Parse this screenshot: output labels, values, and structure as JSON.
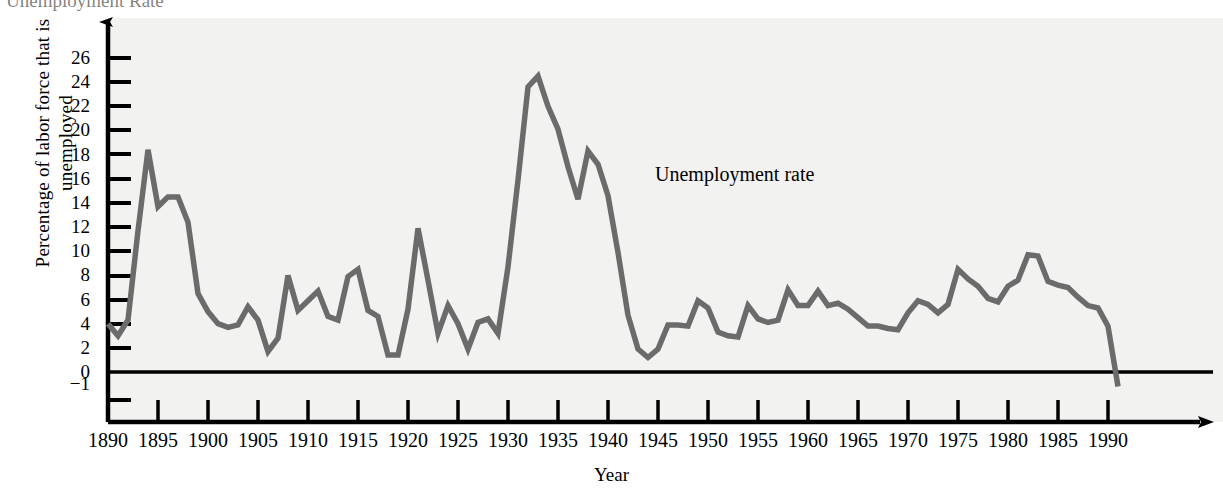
{
  "figure": {
    "clipped_heading": "Unemployment Rate",
    "background_color": "#f2f2f0",
    "line_color": "#6b6b6b",
    "axis_color": "#000000"
  },
  "annotations": [
    {
      "name": "series-label",
      "text": "Unemployment rate",
      "x": 655,
      "y": 164
    }
  ],
  "chart_data": {
    "type": "line",
    "title": "Unemployment Rate",
    "xlabel": "Year",
    "ylabel": "Percentage of labor force that is unemployed",
    "xlim": [
      1890,
      1991
    ],
    "ylim": [
      -1,
      27
    ],
    "grid": false,
    "legend": "none",
    "series_name": "Unemployment rate",
    "x_ticks": [
      1890,
      1895,
      1900,
      1905,
      1910,
      1915,
      1920,
      1925,
      1930,
      1935,
      1940,
      1945,
      1950,
      1955,
      1960,
      1965,
      1970,
      1975,
      1980,
      1985,
      1990
    ],
    "x_tick_labels": [
      "1890",
      "1895",
      "1900",
      "1905",
      "1910",
      "1915",
      "1920",
      "1925",
      "1930",
      "1935",
      "1940",
      "1945",
      "1950",
      "1955",
      "1960",
      "1965",
      "1970",
      "1975",
      "1980",
      "1985",
      "1990"
    ],
    "y_ticks": [
      -1,
      0,
      2,
      4,
      6,
      8,
      10,
      12,
      14,
      16,
      18,
      20,
      22,
      24,
      26
    ],
    "y_tick_labels": [
      "−1",
      "0",
      "2",
      "4",
      "6",
      "8",
      "10",
      "12",
      "14",
      "16",
      "18",
      "20",
      "22",
      "24",
      "26"
    ],
    "x": [
      1890,
      1891,
      1892,
      1893,
      1894,
      1895,
      1896,
      1897,
      1898,
      1899,
      1900,
      1901,
      1902,
      1903,
      1904,
      1905,
      1906,
      1907,
      1908,
      1909,
      1910,
      1911,
      1912,
      1913,
      1914,
      1915,
      1916,
      1917,
      1918,
      1919,
      1920,
      1921,
      1922,
      1923,
      1924,
      1925,
      1926,
      1927,
      1928,
      1929,
      1930,
      1931,
      1932,
      1933,
      1934,
      1935,
      1936,
      1937,
      1938,
      1939,
      1940,
      1941,
      1942,
      1943,
      1944,
      1945,
      1946,
      1947,
      1948,
      1949,
      1950,
      1951,
      1952,
      1953,
      1954,
      1955,
      1956,
      1957,
      1958,
      1959,
      1960,
      1961,
      1962,
      1963,
      1964,
      1965,
      1966,
      1967,
      1968,
      1969,
      1970,
      1971,
      1972,
      1973,
      1974,
      1975,
      1976,
      1977,
      1978,
      1979,
      1980,
      1981,
      1982,
      1983,
      1984,
      1985,
      1986,
      1987,
      1988,
      1989,
      1990,
      1991
    ],
    "y": [
      4.0,
      3.0,
      4.3,
      11.7,
      18.4,
      13.7,
      14.5,
      14.5,
      12.4,
      6.5,
      5.0,
      4.0,
      3.7,
      3.9,
      5.4,
      4.3,
      1.7,
      2.8,
      8.0,
      5.1,
      5.9,
      6.7,
      4.6,
      4.3,
      7.9,
      8.5,
      5.1,
      4.6,
      1.4,
      1.4,
      5.2,
      11.9,
      7.6,
      3.2,
      5.5,
      4.0,
      1.9,
      4.1,
      4.4,
      3.2,
      8.7,
      15.9,
      23.6,
      24.5,
      22.0,
      20.1,
      17.0,
      14.3,
      18.3,
      17.2,
      14.6,
      9.9,
      4.7,
      1.9,
      1.2,
      1.9,
      3.9,
      3.9,
      3.8,
      5.9,
      5.3,
      3.3,
      3.0,
      2.9,
      5.5,
      4.4,
      4.1,
      4.3,
      6.8,
      5.5,
      5.5,
      6.7,
      5.5,
      5.7,
      5.2,
      4.5,
      3.8,
      3.8,
      3.6,
      3.5,
      4.9,
      5.9,
      5.6,
      4.9,
      5.6,
      8.5,
      7.7,
      7.1,
      6.1,
      5.8,
      7.1,
      7.6,
      9.7,
      9.6,
      7.5,
      7.2,
      7.0,
      6.2,
      5.5,
      5.3,
      3.8,
      -1.2
    ]
  }
}
